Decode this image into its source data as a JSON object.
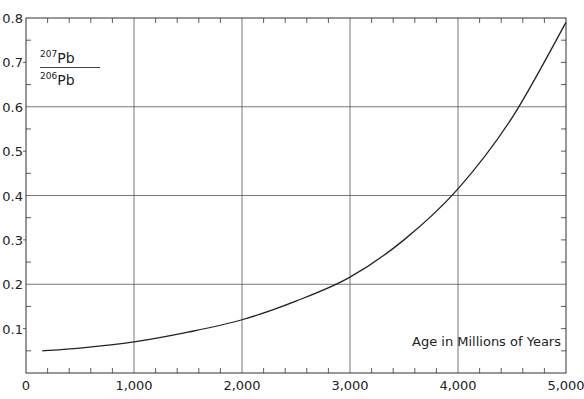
{
  "chart_data": {
    "type": "line",
    "title": "",
    "xlabel": "Age in Millions of Years",
    "ylabel_num_sup": "207",
    "ylabel_num": "Pb",
    "ylabel_den_sup": "206",
    "ylabel_den": "Pb",
    "xlim": [
      0,
      5000
    ],
    "ylim": [
      0,
      0.8
    ],
    "x_ticks": [
      "0",
      "1,000",
      "2,000",
      "3,000",
      "4,000",
      "5,000"
    ],
    "y_ticks": [
      "0.1",
      "0.2",
      "0.3",
      "0.4",
      "0.5",
      "0.6",
      "0.7",
      "0.8"
    ],
    "grid": true,
    "series": [
      {
        "name": "207Pb/206Pb ratio",
        "x": [
          150,
          500,
          1000,
          1500,
          2000,
          2500,
          3000,
          3500,
          4000,
          4500,
          5000
        ],
        "values": [
          0.05,
          0.056,
          0.07,
          0.092,
          0.12,
          0.162,
          0.216,
          0.3,
          0.415,
          0.575,
          0.79
        ]
      }
    ]
  }
}
